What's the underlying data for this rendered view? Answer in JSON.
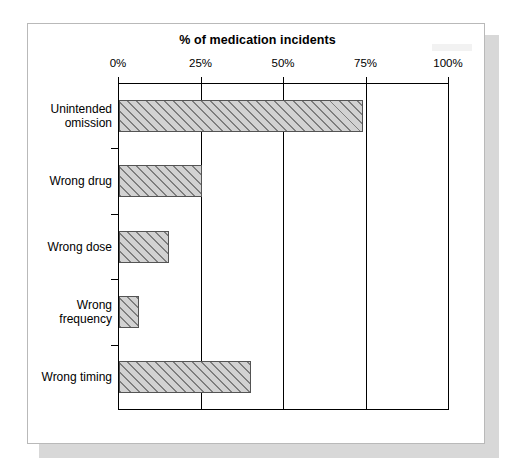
{
  "figure": {
    "title": "% of medication incidents"
  },
  "chart_data": {
    "type": "bar",
    "orientation": "horizontal",
    "title": "% of medication incidents",
    "xlabel": "% of medication incidents",
    "ylabel": "",
    "categories": [
      "Unintended\nomission",
      "Wrong drug",
      "Wrong dose",
      "Wrong\nfrequency",
      "Wrong timing"
    ],
    "values": [
      74,
      25,
      15,
      6,
      40
    ],
    "xlim": [
      0,
      100
    ],
    "xticks": [
      0,
      25,
      50,
      75,
      100
    ],
    "xtick_labels": [
      "0%",
      "25%",
      "50%",
      "75%",
      "100%"
    ],
    "grid": true,
    "legend": "none",
    "bar_fill_color": "#d2d2d2",
    "bar_hatch_color": "#7e7e7e",
    "bar_edge_color": "#545454",
    "hatch": "diagonal"
  }
}
